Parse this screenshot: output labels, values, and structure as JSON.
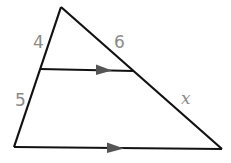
{
  "diagram": {
    "type": "triangle-proportionality",
    "colors": {
      "stroke": "#111111",
      "label": "#8a8a8a",
      "background": "#ffffff"
    },
    "vertices": {
      "apex": [
        61,
        7
      ],
      "bottom_left": [
        14,
        147
      ],
      "bottom_right": [
        222,
        149
      ],
      "mid_left": [
        40,
        69
      ],
      "mid_right": [
        134,
        71
      ]
    },
    "labels": {
      "upper_left_segment": "4",
      "upper_right_segment": "6",
      "lower_left_segment": "5",
      "lower_right_segment": "x"
    },
    "parallel_marks": [
      "mid-segment arrow",
      "base arrow"
    ]
  }
}
